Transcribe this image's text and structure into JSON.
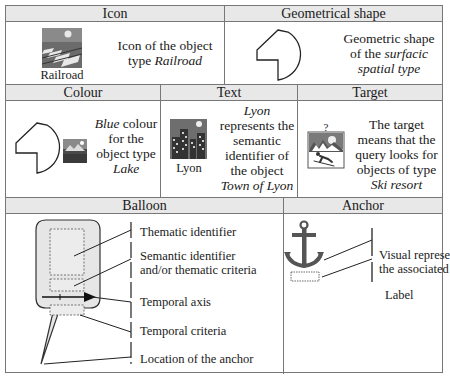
{
  "row1": {
    "icon": {
      "header": "Icon",
      "icon_caption": "Railroad",
      "description_plain": "Icon of the object type ",
      "description_italic": "Railroad",
      "desc_line1": "Icon of the object",
      "desc_line2_plain": "type ",
      "desc_line2_italic": "Railroad"
    },
    "geometrical_shape": {
      "header": "Geometrical shape",
      "desc_line1": "Geometric shape",
      "desc_line2_plain": "of the ",
      "desc_line2_italic": "surfacic",
      "desc_line3_italic": "spatial type"
    }
  },
  "row2": {
    "colour": {
      "header": "Colour",
      "desc_line1_italic": "Blue",
      "desc_line1_plain": " colour",
      "desc_line2": "for the",
      "desc_line3": "object type",
      "desc_line4_italic": "Lake"
    },
    "text": {
      "header": "Text",
      "icon_caption": "Lyon",
      "desc_line1_italic": "Lyon",
      "desc_line2": "represents the",
      "desc_line3": "semantic",
      "desc_line4": "identifier of",
      "desc_line5": "the object",
      "desc_line6_italic": "Town of Lyon"
    },
    "target": {
      "header": "Target",
      "question_mark": "?",
      "desc_line1": "The target",
      "desc_line2": "means that the",
      "desc_line3": "query looks for",
      "desc_line4": "objects of type",
      "desc_line5_italic": "Ski resort"
    }
  },
  "row3": {
    "balloon": {
      "header": "Balloon",
      "labels": [
        "Thematic identifier",
        "Semantic identifier",
        "and/or thematic criteria",
        "Temporal axis",
        "Temporal criteria",
        "Location of the anchor"
      ]
    },
    "anchor": {
      "header": "Anchor",
      "labels": [
        "Visual represe",
        "the associated",
        "Label"
      ]
    }
  },
  "colors": {
    "border": "#777777",
    "header_bg": "#e8e8e8",
    "balloon_fill": "#e6e6e6",
    "anchor_icon": "#555555"
  }
}
